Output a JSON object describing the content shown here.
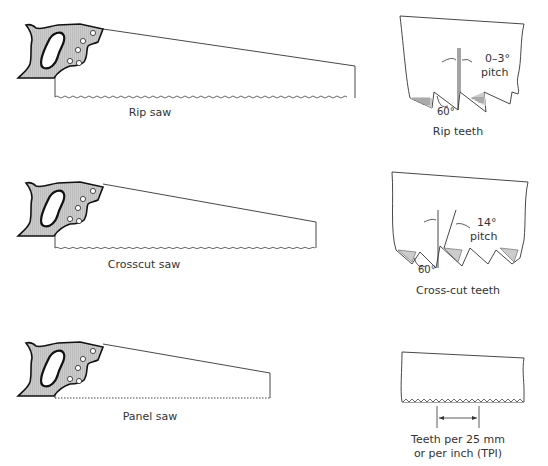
{
  "saws": [
    {
      "name": "rip-saw",
      "label": "Rip saw"
    },
    {
      "name": "crosscut-saw",
      "label": "Crosscut saw"
    },
    {
      "name": "panel-saw",
      "label": "Panel saw"
    }
  ],
  "details": {
    "rip": {
      "caption": "Rip teeth",
      "angle_label": "0–3°",
      "pitch_label": "pitch",
      "tooth_angle": "60°"
    },
    "crosscut": {
      "caption": "Cross-cut teeth",
      "angle_label": "14°",
      "pitch_label": "pitch",
      "tooth_angle": "60°"
    },
    "tpi": {
      "caption_line1": "Teeth per 25 mm",
      "caption_line2": "or per inch (TPI)"
    }
  }
}
